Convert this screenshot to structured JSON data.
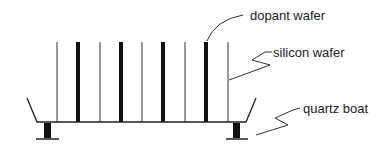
{
  "diagram": {
    "labels": {
      "dopant": "dopant wafer",
      "silicon": "silicon wafer",
      "boat": "quartz boat"
    },
    "colors": {
      "stroke": "#222222",
      "thin_wafer": "#555555",
      "background": "#ffffff"
    },
    "wafers": [
      {
        "type": "silicon"
      },
      {
        "type": "dopant"
      },
      {
        "type": "silicon"
      },
      {
        "type": "dopant"
      },
      {
        "type": "silicon"
      },
      {
        "type": "dopant"
      },
      {
        "type": "silicon"
      },
      {
        "type": "dopant"
      },
      {
        "type": "silicon"
      }
    ]
  }
}
